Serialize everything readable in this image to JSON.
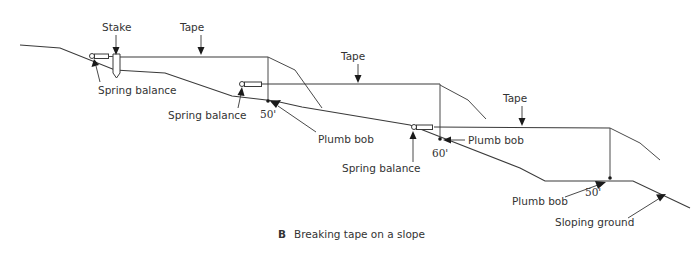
{
  "figure": {
    "caption_letter": "B",
    "caption_text": "Breaking tape on a slope"
  },
  "labels": {
    "stake": "Stake",
    "tape_1": "Tape",
    "tape_2": "Tape",
    "tape_3": "Tape",
    "spring_balance_1": "Spring balance",
    "spring_balance_2": "Spring balance",
    "spring_balance_3": "Spring balance",
    "plumb_bob_1": "Plumb bob",
    "plumb_bob_2": "Plumb bob",
    "plumb_bob_3": "Plumb bob",
    "sloping_ground": "Sloping ground"
  },
  "dimensions": {
    "segment_1": "50'",
    "segment_2": "60'",
    "segment_3": "50'"
  },
  "colors": {
    "line": "#3a3a3a",
    "text": "#333333",
    "background": "#ffffff"
  }
}
